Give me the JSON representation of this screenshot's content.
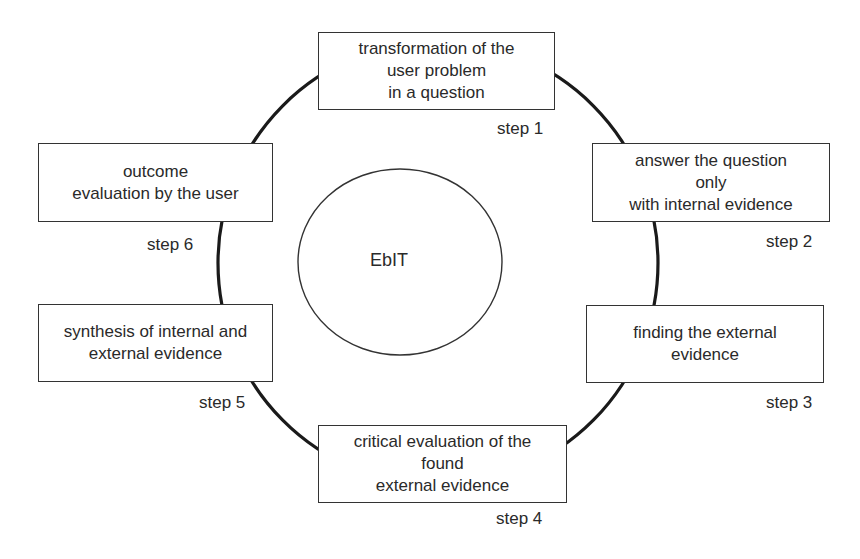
{
  "diagram": {
    "center_label": "EbIT",
    "steps": [
      {
        "step_label": "step 1",
        "lines": [
          "transformation of the",
          "user problem",
          "in a question"
        ]
      },
      {
        "step_label": "step 2",
        "lines": [
          "answer the question",
          "only",
          "with internal evidence"
        ]
      },
      {
        "step_label": "step 3",
        "lines": [
          "finding the external",
          "evidence"
        ]
      },
      {
        "step_label": "step 4",
        "lines": [
          "critical evaluation of the",
          "found",
          "external evidence"
        ]
      },
      {
        "step_label": "step 5",
        "lines": [
          "synthesis of internal and",
          "external evidence"
        ]
      },
      {
        "step_label": "step 6",
        "lines": [
          "outcome",
          "evaluation by the user"
        ]
      }
    ],
    "colors": {
      "line": "#1a1a1a",
      "border": "#333333",
      "text": "#2a2a2a",
      "background": "#ffffff"
    }
  }
}
